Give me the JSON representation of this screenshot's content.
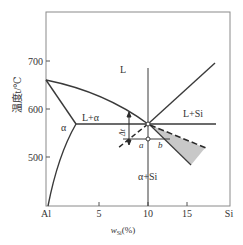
{
  "diagram": {
    "type": "binary phase diagram",
    "system": "Al-Si",
    "axes": {
      "y_label": "温度t/℃",
      "y_ticks": [
        "700",
        "600",
        "500"
      ],
      "x_label_var": "w",
      "x_label_sub": "Si",
      "x_label_unit": "(%)",
      "x_ticks": [
        "Al",
        "5",
        "10",
        "15",
        "Si"
      ]
    },
    "regions": {
      "liquid": "L",
      "liquid_alpha": "L+α",
      "liquid_si": "L+Si",
      "alpha": "α",
      "alpha_si": "α+Si"
    },
    "annotations": {
      "delta_t": "Δt",
      "point_a": "a",
      "point_b": "b"
    },
    "key_points": {
      "al_melting_c": 660,
      "eutectic_temp_c": 577,
      "eutectic_composition_pct": 12.6
    },
    "colors": {
      "line": "#3a3a3a",
      "frame": "#888888",
      "shade": "#c8c8c8"
    }
  }
}
